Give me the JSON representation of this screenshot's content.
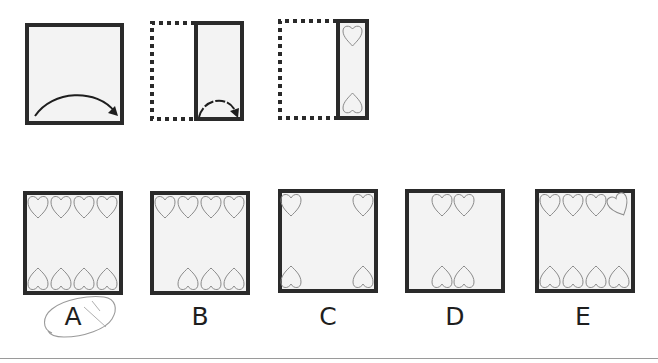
{
  "puzzle": {
    "type": "paper folding",
    "steps": [
      {
        "id": "step-1",
        "description": "Square sheet with arrow indicating fold from left to right"
      },
      {
        "id": "step-2",
        "description": "Sheet folded in half; dotted outline shows original left half; arrow indicates a second fold"
      },
      {
        "id": "step-3",
        "description": "Sheet folded into quarter strip; two heart shapes punched, one at top and one at bottom"
      }
    ],
    "step3_hearts": {
      "top": 1,
      "bottom": 1
    }
  },
  "options": [
    {
      "label": "A",
      "top_hearts": 4,
      "bottom_hearts": 4,
      "circled": true
    },
    {
      "label": "B",
      "top_hearts": 4,
      "bottom_hearts": 3,
      "circled": false
    },
    {
      "label": "C",
      "top_hearts": 2,
      "bottom_hearts": 2,
      "circled": false
    },
    {
      "label": "D",
      "top_hearts": 2,
      "bottom_hearts": 2,
      "circled": false
    },
    {
      "label": "E",
      "top_hearts": 4,
      "bottom_hearts": 4,
      "circled": false
    }
  ],
  "colors": {
    "outline": "#2a2a2a",
    "sheet_fill": "#f3f3f3",
    "heart_stroke": "#8a8a8a",
    "pencil_mark": "#9a9a9a"
  }
}
